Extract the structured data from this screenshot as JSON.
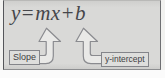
{
  "figure": {
    "background_color": "#d9d9d7",
    "border_color": "#55565a"
  },
  "equation": {
    "full_text": "y = mx + b",
    "parts": {
      "y": "y",
      "equals": "=",
      "m": "m",
      "x": "x",
      "plus": "+",
      "b": "b"
    },
    "text_color": "#46464a"
  },
  "annotations": [
    {
      "id": "slope",
      "label": "Slope",
      "points_to": "m",
      "arrow_direction": "up",
      "arrow_tail_side": "left"
    },
    {
      "id": "y-intercept",
      "label": "y-intercept",
      "points_to": "b",
      "arrow_direction": "up",
      "arrow_tail_side": "right"
    }
  ],
  "arrows": {
    "fill_color": "#e9e9e7",
    "stroke_color": "#8a8b8f"
  }
}
